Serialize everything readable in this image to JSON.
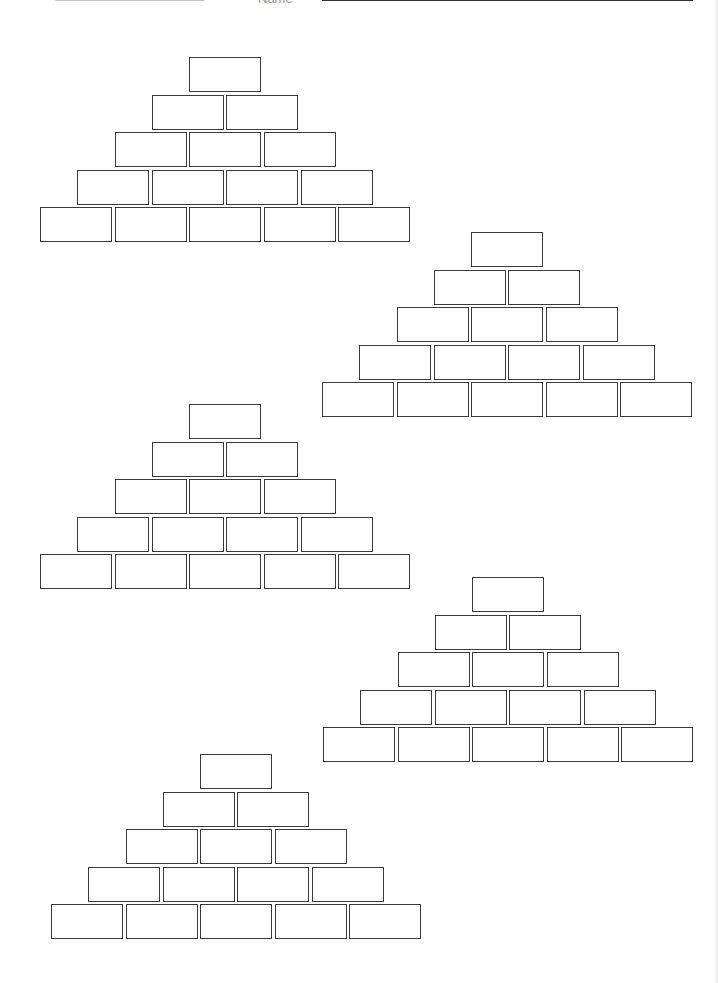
{
  "header": {
    "name_label": "Name",
    "name_value": ""
  },
  "worksheet": {
    "type": "number-pyramid",
    "rows_per_pyramid": 5,
    "brick": {
      "width": 72,
      "height": 35,
      "h_pitch": 74.5,
      "v_pitch": 37.5
    },
    "pyramids": [
      {
        "id": 1,
        "top_x": 189,
        "top_y": 57,
        "values": [
          [
            ""
          ],
          [
            "",
            ""
          ],
          [
            "",
            "",
            ""
          ],
          [
            "",
            "",
            "",
            ""
          ],
          [
            "",
            "",
            "",
            "",
            ""
          ]
        ]
      },
      {
        "id": 2,
        "top_x": 471,
        "top_y": 232,
        "values": [
          [
            ""
          ],
          [
            "",
            ""
          ],
          [
            "",
            "",
            ""
          ],
          [
            "",
            "",
            "",
            ""
          ],
          [
            "",
            "",
            "",
            "",
            ""
          ]
        ]
      },
      {
        "id": 3,
        "top_x": 189,
        "top_y": 404,
        "values": [
          [
            ""
          ],
          [
            "",
            ""
          ],
          [
            "",
            "",
            ""
          ],
          [
            "",
            "",
            "",
            ""
          ],
          [
            "",
            "",
            "",
            "",
            ""
          ]
        ]
      },
      {
        "id": 4,
        "top_x": 472,
        "top_y": 577,
        "values": [
          [
            ""
          ],
          [
            "",
            ""
          ],
          [
            "",
            "",
            ""
          ],
          [
            "",
            "",
            "",
            ""
          ],
          [
            "",
            "",
            "",
            "",
            ""
          ]
        ]
      },
      {
        "id": 5,
        "top_x": 200,
        "top_y": 754,
        "values": [
          [
            ""
          ],
          [
            "",
            ""
          ],
          [
            "",
            "",
            ""
          ],
          [
            "",
            "",
            "",
            ""
          ],
          [
            "",
            "",
            "",
            "",
            ""
          ]
        ]
      }
    ]
  }
}
